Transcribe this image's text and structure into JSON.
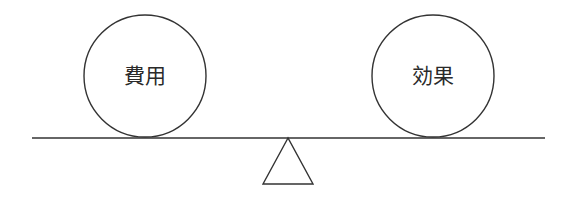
{
  "diagram": {
    "type": "balance-scale",
    "left_weight": {
      "label": "費用"
    },
    "right_weight": {
      "label": "効果"
    },
    "stroke_color": "#333333",
    "background": "#ffffff"
  }
}
